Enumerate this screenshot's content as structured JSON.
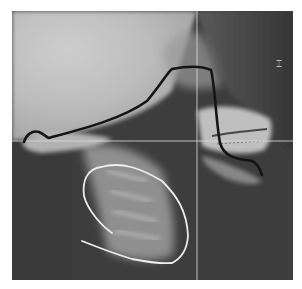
{
  "image": {
    "type": "lateral cephalometric radiograph",
    "description": "Lateral skull and cervical spine X-ray with hand-drawn tracings",
    "width": 281,
    "height": 269,
    "offset": {
      "x": 12,
      "y": 11
    }
  },
  "annotations": {
    "tongue_outline": {
      "label": "tongue outline",
      "color": "#151515"
    },
    "airway_outline": {
      "label": "cervical / airway outline",
      "color": "#e8e8e8"
    },
    "vertical_reference_line": {
      "label": "vertical reference line",
      "color": "#d8d8d8",
      "x": 197
    },
    "horizontal_reference_line": {
      "label": "horizontal reference line",
      "color": "#d8d8d8",
      "y": 141
    }
  },
  "colors": {
    "skull_light": "#c4c4c4",
    "soft_tissue_dark": "#3c3c3c",
    "bone_bright": "#e6e6e6",
    "background": "#ffffff"
  }
}
